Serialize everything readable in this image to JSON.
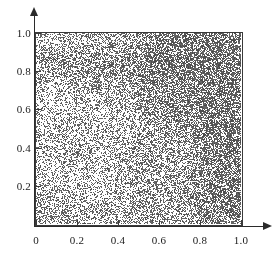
{
  "chart_data": {
    "type": "scatter",
    "title": "",
    "subtitle": "",
    "xlabel": "",
    "ylabel": "",
    "xlim": [
      0,
      1
    ],
    "ylim": [
      0,
      1
    ],
    "grid": false,
    "legend": null,
    "annotations": [],
    "marker": {
      "shape": "point",
      "color": "#4a4a4a",
      "size_px": 1,
      "opacity": 0.85
    },
    "n_points": 14000,
    "density_model": {
      "kind": "gradient-plus-bands",
      "base_density": 0.3,
      "corner_focus": {
        "x": 1.0,
        "y": 0.95,
        "weight": 0.62,
        "radius": 0.55
      },
      "right_edge_band": {
        "x_center": 1.0,
        "weight": 0.3,
        "width": 0.18
      },
      "horizontal_band": {
        "y_center": 0.855,
        "weight": 0.22,
        "height": 0.055
      },
      "bottom_band": {
        "y_center": 0.07,
        "weight": 0.12,
        "height": 0.1
      },
      "left_edge_band": {
        "x_center": 0.0,
        "weight": 0.1,
        "width": 0.05
      }
    },
    "x_ticks": [
      {
        "value": 0,
        "label": "0"
      },
      {
        "value": 0.2,
        "label": "0.2"
      },
      {
        "value": 0.4,
        "label": "0.4"
      },
      {
        "value": 0.6,
        "label": "0.6"
      },
      {
        "value": 0.8,
        "label": "0.8"
      },
      {
        "value": 1.0,
        "label": "1.0"
      }
    ],
    "y_ticks": [
      {
        "value": 0.2,
        "label": "0.2"
      },
      {
        "value": 0.4,
        "label": "0.4"
      },
      {
        "value": 0.6,
        "label": "0.6"
      },
      {
        "value": 0.8,
        "label": "0.8"
      },
      {
        "value": 1.0,
        "label": "1.0"
      }
    ],
    "axes": {
      "x_arrow": true,
      "y_arrow": true,
      "frame": true,
      "frame_color": "#3a3a3a",
      "axis_color": "#2b2b2b"
    }
  }
}
